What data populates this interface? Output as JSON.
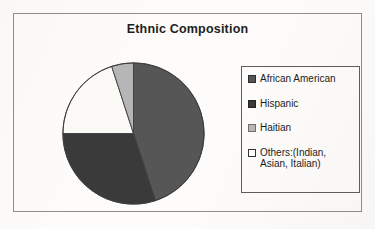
{
  "chart_data": {
    "type": "pie",
    "title": "Ethnic Composition",
    "xlabel": "",
    "ylabel": "",
    "legend_position": "right",
    "grid": false,
    "categories": [
      "African American",
      "Hispanic",
      "Haitian",
      "Others:(Indian, Asian, Italian)"
    ],
    "values": [
      45,
      30,
      5,
      20
    ],
    "slice_colors": [
      "#565656",
      "#3a3a3a",
      "#b6b6b6",
      "#fbfaf7"
    ],
    "slices": [
      {
        "label": "African American",
        "value": 45,
        "color": "#565656",
        "start_angle": 0,
        "end_angle": 162
      },
      {
        "label": "Hispanic",
        "value": 30,
        "color": "#3a3a3a",
        "start_angle": 162,
        "end_angle": 270
      },
      {
        "label": "Others:(Indian, Asian, Italian)",
        "value": 20,
        "color": "#fbfaf7",
        "start_angle": 270,
        "end_angle": 342
      },
      {
        "label": "Haitian",
        "value": 5,
        "color": "#b6b6b6",
        "start_angle": 342,
        "end_angle": 360
      }
    ]
  },
  "legend": {
    "entries": [
      {
        "label": "African American",
        "swatch_color": "#565656",
        "swatch_border": "#2e2e2e"
      },
      {
        "label": "Hispanic",
        "swatch_color": "#3a3a3a",
        "swatch_border": "#232323"
      },
      {
        "label": "Haitian",
        "swatch_color": "#b6b6b6",
        "swatch_border": "#6f6f6f"
      },
      {
        "label": "Others:(Indian,\nAsian, Italian)",
        "swatch_color": "#fdfdfb",
        "swatch_border": "#333333"
      }
    ]
  },
  "style": {
    "background": "#fdfcfa",
    "frame_border": "#8d8d8d",
    "legend_border": "#5d5d5d",
    "text_color": "#1c1c1c",
    "pie_outline": "#3c3c3c"
  }
}
